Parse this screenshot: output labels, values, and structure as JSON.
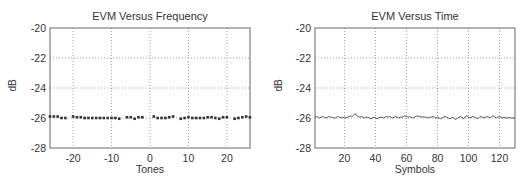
{
  "chart_data": [
    {
      "type": "scatter",
      "title": "EVM Versus Frequency",
      "xlabel": "Tones",
      "ylabel": "dB",
      "xlim": [
        -26,
        26
      ],
      "ylim": [
        -28,
        -20
      ],
      "xticks": [
        -20,
        -10,
        0,
        10,
        20
      ],
      "yticks": [
        -20,
        -22,
        -24,
        -26,
        -28
      ],
      "grid": true,
      "x": [
        -26,
        -25,
        -24,
        -23,
        -22,
        -20,
        -19,
        -18,
        -17,
        -16,
        -15,
        -14,
        -13,
        -12,
        -11,
        -10,
        -9,
        -8,
        -6,
        -5,
        -4,
        -3,
        -2,
        1,
        2,
        3,
        4,
        5,
        6,
        8,
        9,
        10,
        11,
        12,
        13,
        14,
        15,
        16,
        17,
        18,
        19,
        20,
        22,
        23,
        24,
        25,
        26
      ],
      "values": [
        -25.9,
        -25.9,
        -25.9,
        -26.0,
        -26.0,
        -25.9,
        -25.95,
        -25.95,
        -26.0,
        -26.0,
        -26.0,
        -26.0,
        -26.0,
        -26.0,
        -26.0,
        -26.0,
        -26.0,
        -26.05,
        -25.95,
        -25.95,
        -26.05,
        -25.95,
        -25.95,
        -25.9,
        -26.0,
        -26.0,
        -26.0,
        -25.95,
        -25.9,
        -26.05,
        -26.0,
        -25.95,
        -26.0,
        -26.0,
        -26.0,
        -26.0,
        -25.95,
        -25.95,
        -26.0,
        -26.05,
        -25.95,
        -25.95,
        -26.05,
        -26.0,
        -25.95,
        -25.9,
        -25.95
      ]
    },
    {
      "type": "line",
      "title": "EVM Versus Time",
      "xlabel": "Symbols",
      "ylabel": "dB",
      "xlim": [
        1,
        130
      ],
      "ylim": [
        -28,
        -20
      ],
      "xticks": [
        20,
        40,
        60,
        80,
        100,
        120
      ],
      "yticks": [
        -20,
        -22,
        -24,
        -26,
        -28
      ],
      "grid": true,
      "x_start": 1,
      "x_step": 1,
      "values": [
        -25.95,
        -25.9,
        -25.95,
        -26.0,
        -25.95,
        -25.9,
        -25.95,
        -26.0,
        -25.95,
        -25.9,
        -25.95,
        -25.95,
        -26.0,
        -26.0,
        -25.95,
        -25.9,
        -25.95,
        -26.0,
        -25.95,
        -25.95,
        -26.0,
        -25.95,
        -25.9,
        -25.85,
        -25.9,
        -25.8,
        -25.7,
        -25.85,
        -25.9,
        -25.95,
        -25.9,
        -25.95,
        -26.0,
        -25.95,
        -25.95,
        -26.0,
        -26.05,
        -26.0,
        -25.95,
        -26.0,
        -26.05,
        -26.0,
        -25.95,
        -25.95,
        -26.0,
        -25.95,
        -25.9,
        -25.95,
        -25.9,
        -25.95,
        -26.0,
        -25.95,
        -25.9,
        -25.95,
        -26.0,
        -25.95,
        -25.95,
        -25.9,
        -25.85,
        -25.9,
        -25.95,
        -25.9,
        -25.95,
        -26.0,
        -25.95,
        -25.9,
        -25.85,
        -25.9,
        -25.9,
        -25.95,
        -25.9,
        -25.95,
        -25.95,
        -26.0,
        -25.95,
        -25.95,
        -25.9,
        -25.95,
        -26.0,
        -25.95,
        -26.0,
        -26.05,
        -26.0,
        -25.95,
        -25.9,
        -25.95,
        -26.0,
        -26.05,
        -26.0,
        -25.95,
        -26.05,
        -26.1,
        -26.0,
        -25.95,
        -25.9,
        -26.0,
        -26.05,
        -25.9,
        -25.85,
        -25.95,
        -26.0,
        -25.95,
        -25.9,
        -25.95,
        -26.0,
        -26.05,
        -25.95,
        -25.9,
        -25.95,
        -26.0,
        -25.95,
        -25.9,
        -25.95,
        -26.0,
        -25.9,
        -25.85,
        -25.95,
        -26.0,
        -25.95,
        -25.9,
        -25.95,
        -26.0,
        -25.95,
        -26.0,
        -26.0,
        -25.95,
        -26.0,
        -26.0,
        -26.0,
        -26.0
      ]
    }
  ],
  "colors": {
    "axis": "#666666",
    "grid": "#888888",
    "data": "#333333",
    "text": "#333333"
  }
}
